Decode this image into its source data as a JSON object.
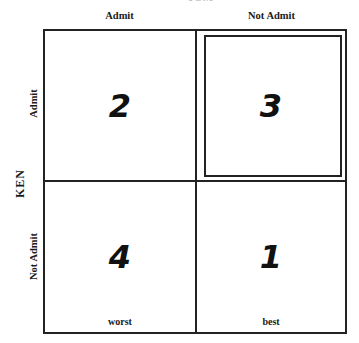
{
  "diagram": {
    "top_title_partial": "TOM",
    "row_axis_label": "KEN",
    "column_labels": [
      "Admit",
      "Not Admit"
    ],
    "row_labels": [
      "Admit",
      "Not Admit"
    ],
    "cells": [
      {
        "row": "Admit",
        "col": "Admit",
        "rank": "2",
        "note": "",
        "highlighted": false
      },
      {
        "row": "Admit",
        "col": "Not Admit",
        "rank": "3",
        "note": "",
        "highlighted": true
      },
      {
        "row": "Not Admit",
        "col": "Admit",
        "rank": "4",
        "note": "worst",
        "highlighted": false
      },
      {
        "row": "Not Admit",
        "col": "Not Admit",
        "rank": "1",
        "note": "best",
        "highlighted": false
      }
    ]
  }
}
